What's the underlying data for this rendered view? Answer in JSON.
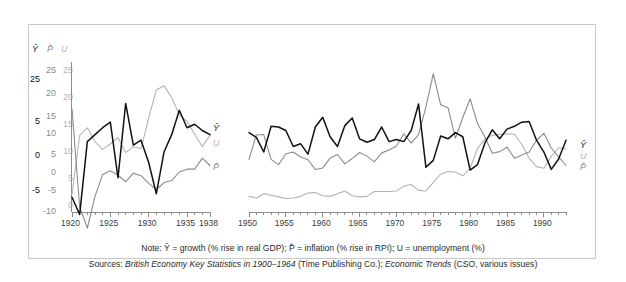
{
  "figure": {
    "background": "#ffffff",
    "frame_color": "#c9c9c9"
  },
  "colors": {
    "growth": "#111111",
    "inflation": "#8c8c8c",
    "unemployment": "#b4b4b4",
    "axis": "#8c8c8c",
    "text": "#2b2b2b"
  },
  "axis_heads": {
    "growth": "Ŷ",
    "inflation": "P̂",
    "unemployment": "U"
  },
  "series_labels": {
    "growth": "Ŷ",
    "unemployment": "U",
    "inflation": "P̂"
  },
  "y_axes": {
    "growth": {
      "label": "Ŷ",
      "ticks": [
        "25",
        "5",
        "0",
        "-5"
      ],
      "tick_values": [
        25,
        5,
        0,
        -5
      ],
      "range": [
        -10,
        30
      ]
    },
    "inflation": {
      "label": "P̂",
      "ticks": [
        "25",
        "20",
        "15",
        "10",
        "5",
        "0",
        "-5",
        "-10"
      ],
      "tick_values": [
        25,
        20,
        15,
        10,
        5,
        0,
        -5,
        -10
      ],
      "range": [
        -12,
        27
      ]
    },
    "unemployment": {
      "label": "U",
      "ticks": [
        "25",
        "20",
        "15",
        "10",
        "5",
        "0"
      ],
      "tick_values": [
        25,
        20,
        15,
        10,
        5,
        0
      ],
      "range": [
        0,
        27
      ]
    }
  },
  "panels": {
    "left": {
      "x_start": 1920,
      "x_end": 1938,
      "tick_labels": [
        "1920",
        "1925",
        "1930",
        "1935",
        "1938"
      ],
      "tick_years": [
        1920,
        1925,
        1930,
        1935,
        1938
      ]
    },
    "right": {
      "x_start": 1950,
      "x_end": 1993,
      "tick_labels": [
        "1950",
        "1955",
        "1960",
        "1965",
        "1970",
        "1975",
        "1980",
        "1985",
        "1990"
      ],
      "tick_years": [
        1950,
        1955,
        1960,
        1965,
        1970,
        1975,
        1980,
        1985,
        1990
      ]
    }
  },
  "notes": {
    "note_prefix": "Note: ",
    "note_text": "Ŷ = growth (% rise in real GDP); P̂ = inflation (% rise in RPI); U = unemployment (%)",
    "sources_prefix": "Sources: ",
    "sources_title_1": "British Economy Key Statistics in 1900–1964",
    "sources_mid": " (Time Publishing Co.); ",
    "sources_title_2": "Economic Trends",
    "sources_tail": " (CSO, various issues)"
  },
  "chart_data": {
    "type": "line",
    "title": "",
    "xlabel": "",
    "ylabel": "",
    "grid": false,
    "legend": "right-edge inline labels",
    "panels": [
      {
        "name": "interwar",
        "xlim": [
          1920,
          1938
        ],
        "x": [
          1920,
          1921,
          1922,
          1923,
          1924,
          1925,
          1926,
          1927,
          1928,
          1929,
          1930,
          1931,
          1932,
          1933,
          1934,
          1935,
          1936,
          1937,
          1938
        ],
        "series": [
          {
            "name": "Ŷ",
            "id": "growth",
            "axis": "growth",
            "color": "#111111",
            "values": [
              -6.0,
              -8.5,
              2.0,
              3.0,
              4.0,
              4.8,
              -3.2,
              7.5,
              1.5,
              2.2,
              -1.0,
              -5.5,
              0.5,
              3.0,
              6.5,
              4.0,
              4.5,
              3.6,
              3.0
            ]
          },
          {
            "name": "P̂",
            "id": "inflation",
            "axis": "inflation",
            "color": "#8c8c8c",
            "values": [
              15.5,
              -8.6,
              -14.0,
              -6.0,
              -0.6,
              0.3,
              -0.8,
              -2.4,
              -0.3,
              -0.9,
              -2.8,
              -4.3,
              -2.6,
              -2.1,
              0.0,
              0.7,
              0.7,
              3.4,
              1.6
            ]
          },
          {
            "name": "U",
            "id": "unemployment",
            "axis": "unemployment",
            "color": "#b4b4b4",
            "values": [
              2.0,
              12.9,
              14.3,
              11.7,
              10.3,
              11.3,
              12.5,
              9.7,
              10.8,
              10.4,
              16.1,
              21.3,
              22.1,
              19.9,
              16.7,
              15.5,
              13.1,
              10.8,
              12.9
            ]
          }
        ]
      },
      {
        "name": "postwar",
        "xlim": [
          1950,
          1993
        ],
        "x": [
          1950,
          1951,
          1952,
          1953,
          1954,
          1955,
          1956,
          1957,
          1958,
          1959,
          1960,
          1961,
          1962,
          1963,
          1964,
          1965,
          1966,
          1967,
          1968,
          1969,
          1970,
          1971,
          1972,
          1973,
          1974,
          1975,
          1976,
          1977,
          1978,
          1979,
          1980,
          1981,
          1982,
          1983,
          1984,
          1985,
          1986,
          1987,
          1988,
          1989,
          1990,
          1991,
          1992,
          1993
        ],
        "series": [
          {
            "name": "Ŷ",
            "id": "growth",
            "axis": "growth",
            "color": "#111111",
            "values": [
              3.3,
              2.6,
              0.5,
              4.2,
              4.1,
              3.6,
              1.3,
              1.7,
              0.2,
              4.1,
              5.5,
              2.7,
              1.3,
              4.3,
              5.4,
              2.4,
              1.9,
              2.3,
              4.1,
              2.0,
              2.3,
              2.0,
              3.6,
              7.4,
              -1.7,
              -0.7,
              2.8,
              2.4,
              3.3,
              2.7,
              -2.1,
              -1.3,
              1.8,
              3.7,
              2.4,
              3.8,
              4.2,
              4.8,
              4.9,
              2.2,
              0.5,
              -2.0,
              -0.5,
              2.2
            ]
          },
          {
            "name": "P̂",
            "id": "inflation",
            "axis": "inflation",
            "color": "#8c8c8c",
            "values": [
              3.1,
              9.1,
              9.2,
              3.1,
              1.8,
              4.5,
              4.9,
              3.7,
              3.0,
              0.6,
              1.0,
              3.4,
              4.3,
              2.0,
              3.3,
              4.8,
              3.9,
              2.5,
              4.7,
              5.4,
              6.4,
              9.4,
              7.1,
              9.2,
              16.0,
              24.2,
              16.5,
              15.8,
              8.3,
              13.4,
              18.0,
              11.9,
              8.6,
              4.6,
              5.0,
              6.1,
              3.4,
              4.2,
              4.9,
              7.8,
              9.5,
              5.9,
              3.7,
              1.6
            ]
          },
          {
            "name": "U",
            "id": "unemployment",
            "axis": "unemployment",
            "color": "#b4b4b4",
            "values": [
              1.6,
              1.3,
              2.1,
              1.8,
              1.5,
              1.2,
              1.3,
              1.6,
              2.2,
              2.3,
              1.7,
              1.6,
              2.1,
              2.6,
              1.7,
              1.5,
              1.6,
              2.5,
              2.5,
              2.5,
              2.6,
              3.5,
              3.8,
              2.7,
              2.6,
              4.2,
              5.7,
              6.2,
              6.1,
              5.4,
              6.8,
              10.5,
              12.2,
              12.9,
              13.1,
              13.2,
              13.1,
              11.2,
              8.7,
              7.1,
              6.8,
              9.0,
              10.6,
              10.4
            ]
          }
        ]
      }
    ]
  }
}
